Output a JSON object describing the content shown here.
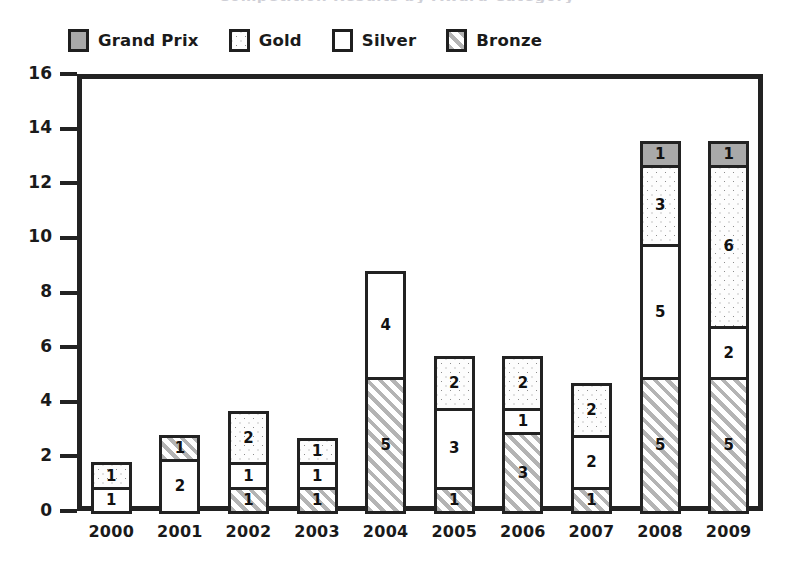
{
  "title_sliver": "Competition Results by Award Category",
  "legend": {
    "position": "top-left",
    "items": [
      {
        "label": "Grand Prix",
        "key": "grand_prix",
        "pattern": "solid-gray",
        "color": "#a9a9a9"
      },
      {
        "label": "Gold",
        "key": "gold",
        "pattern": "dotted",
        "color": "#ffffff"
      },
      {
        "label": "Silver",
        "key": "silver",
        "pattern": "empty",
        "color": "#ffffff"
      },
      {
        "label": "Bronze",
        "key": "bronze",
        "pattern": "diagonal-hatch",
        "color": "#ffffff"
      }
    ]
  },
  "axes": {
    "y_ticks": [
      0,
      2,
      4,
      6,
      8,
      10,
      12,
      14,
      16
    ],
    "y_min": 0,
    "y_max": 16,
    "grid": false
  },
  "chart_data": {
    "type": "bar",
    "subtype": "stacked-vertical",
    "title": "Competition Results by Award Category",
    "xlabel": "",
    "ylabel": "",
    "ylim": [
      0,
      16
    ],
    "ytick_step": 2,
    "grid": false,
    "legend_position": "top-left",
    "categories": [
      "2000",
      "2001",
      "2002",
      "2003",
      "2004",
      "2005",
      "2006",
      "2007",
      "2008",
      "2009"
    ],
    "stack_order_bottom_to_top": [
      "Bronze",
      "Silver",
      "Gold",
      "Grand Prix"
    ],
    "series": [
      {
        "name": "Bronze",
        "values": [
          0,
          1,
          1,
          1,
          5,
          1,
          3,
          1,
          5,
          5
        ]
      },
      {
        "name": "Silver",
        "values": [
          1,
          2,
          1,
          1,
          4,
          3,
          1,
          2,
          5,
          2
        ]
      },
      {
        "name": "Gold",
        "values": [
          1,
          0,
          2,
          1,
          0,
          2,
          2,
          2,
          3,
          6
        ]
      },
      {
        "name": "Grand Prix",
        "values": [
          0,
          0,
          0,
          0,
          0,
          0,
          0,
          0,
          1,
          1
        ]
      }
    ],
    "totals": [
      2,
      3,
      4,
      3,
      9,
      6,
      6,
      5,
      14,
      14
    ]
  },
  "bars": [
    {
      "year": "2000",
      "total": 2,
      "segments": [
        {
          "series": "Silver",
          "value": 1,
          "label": "1"
        },
        {
          "series": "Gold",
          "value": 1,
          "label": "1"
        }
      ]
    },
    {
      "year": "2001",
      "total": 3,
      "segments": [
        {
          "series": "Silver",
          "value": 2,
          "label": "2"
        },
        {
          "series": "Bronze",
          "value": 1,
          "label": "1"
        }
      ]
    },
    {
      "year": "2002",
      "total": 4,
      "segments": [
        {
          "series": "Bronze",
          "value": 1,
          "label": "1"
        },
        {
          "series": "Silver",
          "value": 1,
          "label": "1"
        },
        {
          "series": "Gold",
          "value": 2,
          "label": "2"
        }
      ]
    },
    {
      "year": "2003",
      "total": 3,
      "segments": [
        {
          "series": "Bronze",
          "value": 1,
          "label": "1"
        },
        {
          "series": "Silver",
          "value": 1,
          "label": "1"
        },
        {
          "series": "Gold",
          "value": 1,
          "label": "1"
        }
      ]
    },
    {
      "year": "2004",
      "total": 9,
      "segments": [
        {
          "series": "Bronze",
          "value": 5,
          "label": "5"
        },
        {
          "series": "Silver",
          "value": 4,
          "label": "4"
        }
      ]
    },
    {
      "year": "2005",
      "total": 6,
      "segments": [
        {
          "series": "Bronze",
          "value": 1,
          "label": "1"
        },
        {
          "series": "Silver",
          "value": 3,
          "label": "3"
        },
        {
          "series": "Gold",
          "value": 2,
          "label": "2"
        }
      ]
    },
    {
      "year": "2006",
      "total": 6,
      "segments": [
        {
          "series": "Bronze",
          "value": 3,
          "label": "3"
        },
        {
          "series": "Silver",
          "value": 1,
          "label": "1"
        },
        {
          "series": "Gold",
          "value": 2,
          "label": "2"
        }
      ]
    },
    {
      "year": "2007",
      "total": 5,
      "segments": [
        {
          "series": "Bronze",
          "value": 1,
          "label": "1"
        },
        {
          "series": "Silver",
          "value": 2,
          "label": "2"
        },
        {
          "series": "Gold",
          "value": 2,
          "label": "2"
        }
      ]
    },
    {
      "year": "2008",
      "total": 14,
      "segments": [
        {
          "series": "Bronze",
          "value": 5,
          "label": "5"
        },
        {
          "series": "Silver",
          "value": 5,
          "label": "5"
        },
        {
          "series": "Gold",
          "value": 3,
          "label": "3"
        },
        {
          "series": "Grand Prix",
          "value": 1,
          "label": "1"
        }
      ]
    },
    {
      "year": "2009",
      "total": 14,
      "segments": [
        {
          "series": "Bronze",
          "value": 5,
          "label": "5"
        },
        {
          "series": "Silver",
          "value": 2,
          "label": "2"
        },
        {
          "series": "Gold",
          "value": 6,
          "label": "6"
        },
        {
          "series": "Grand Prix",
          "value": 1,
          "label": "1"
        }
      ]
    }
  ],
  "colors": {
    "axis": "#222222",
    "text": "#1a1a1a",
    "grand_prix": "#a9a9a9",
    "gold": "#ffffff",
    "silver": "#ffffff",
    "bronze": "#ffffff",
    "hatch": "#b4b4b4",
    "dot": "#8d8d8d"
  }
}
